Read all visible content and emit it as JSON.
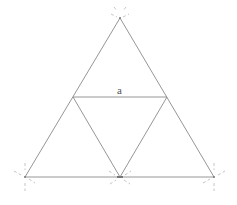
{
  "diagram": {
    "labels": {
      "midline_label": "a"
    },
    "colors": {
      "lines": "#8a8a8a",
      "construction_marks": "#b5b5b5",
      "label": "#555555",
      "background": "#ffffff"
    },
    "points": [
      "apex",
      "bottom-left",
      "bottom-middle",
      "bottom-right",
      "mid-left",
      "mid-right"
    ],
    "segments": [
      {
        "from": "apex",
        "to": "bottom-left"
      },
      {
        "from": "apex",
        "to": "bottom-right"
      },
      {
        "from": "bottom-left",
        "to": "bottom-right"
      },
      {
        "from": "mid-left",
        "to": "mid-right",
        "label": "a"
      },
      {
        "from": "mid-left",
        "to": "bottom-middle"
      },
      {
        "from": "mid-right",
        "to": "bottom-middle"
      }
    ]
  }
}
